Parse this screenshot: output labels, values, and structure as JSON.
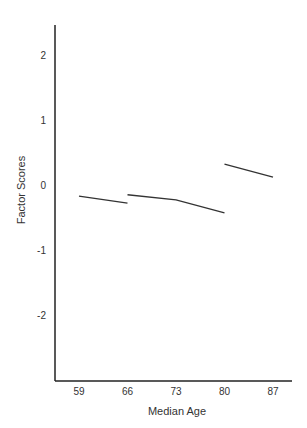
{
  "chart_data": {
    "type": "line",
    "title": "",
    "xlabel": "Median Age",
    "ylabel": "Factor Scores",
    "x_ticks": [
      59,
      66,
      73,
      80,
      87
    ],
    "y_ticks": [
      2,
      1,
      0,
      -1,
      -2
    ],
    "xlim": [
      55.5,
      90.5
    ],
    "ylim": [
      -3.0,
      2.45
    ],
    "grid": false,
    "legend": null,
    "series": [
      {
        "name": "segment-1",
        "x": [
          59,
          66
        ],
        "y": [
          -0.17,
          -0.28
        ]
      },
      {
        "name": "segment-2",
        "x": [
          66,
          73,
          80
        ],
        "y": [
          -0.15,
          -0.23,
          -0.43
        ]
      },
      {
        "name": "segment-3",
        "x": [
          80,
          87
        ],
        "y": [
          0.32,
          0.12
        ]
      }
    ]
  },
  "colors": {
    "axis": "#222222",
    "line": "#333333",
    "text": "#333333"
  }
}
